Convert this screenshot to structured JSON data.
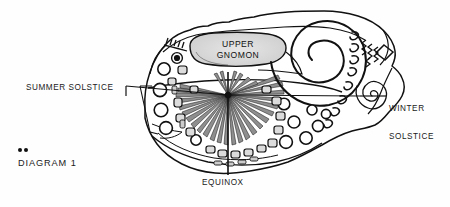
{
  "figure": {
    "kind": "petroglyph-line-drawing",
    "caption_label": "DIAGRAM 1",
    "caption_bullet_count": 2,
    "background_color": "#fefefe",
    "ink_color": "#111111",
    "shade_color": "#d9d9d9",
    "labels": {
      "summer_solstice": "SUMMER SOLSTICE",
      "winter_solstice_line1": "WINTER",
      "winter_solstice_line2": "SOLSTICE",
      "equinox": "EQUINOX",
      "gnomon_line1": "UPPER",
      "gnomon_line2": "GNOMON"
    },
    "markers": {
      "center_point_label": "gnomon-center-point",
      "center_x": 228,
      "center_y": 95
    },
    "elements": {
      "large_spiral_turns": 6,
      "small_spiral_turns": 5,
      "sunburst_ray_count": 31,
      "cupmark_circle_count": 14,
      "rounded_glyph_count": 22,
      "zigzag_count": 4,
      "arc_hook_count": 4,
      "diamond_count": 1
    }
  }
}
